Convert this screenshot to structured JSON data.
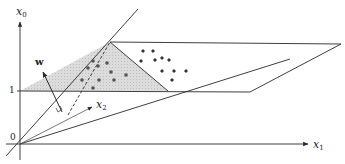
{
  "diagram": {
    "axes": {
      "x0": {
        "label": "x",
        "sub": "0"
      },
      "x1": {
        "label": "x",
        "sub": "1"
      },
      "x2": {
        "label": "x",
        "sub": "2"
      }
    },
    "ticks": {
      "origin": "0",
      "one": "1"
    },
    "normal_vector": {
      "label": "w"
    },
    "colors": {
      "line": "#2a2a2a",
      "plane_fill": "#d9d9d9",
      "dots": "#444444"
    },
    "class_a_points": [
      [
        93,
        61
      ],
      [
        88,
        68
      ],
      [
        98,
        66
      ],
      [
        110,
        72
      ],
      [
        82,
        80
      ],
      [
        100,
        80
      ],
      [
        115,
        80
      ],
      [
        93,
        88
      ]
    ],
    "class_b_points": [
      [
        143,
        51
      ],
      [
        153,
        51
      ],
      [
        141,
        60
      ],
      [
        155,
        60
      ],
      [
        162,
        58
      ],
      [
        170,
        60
      ],
      [
        153,
        70
      ],
      [
        165,
        70
      ],
      [
        183,
        70
      ],
      [
        160,
        80
      ]
    ]
  }
}
